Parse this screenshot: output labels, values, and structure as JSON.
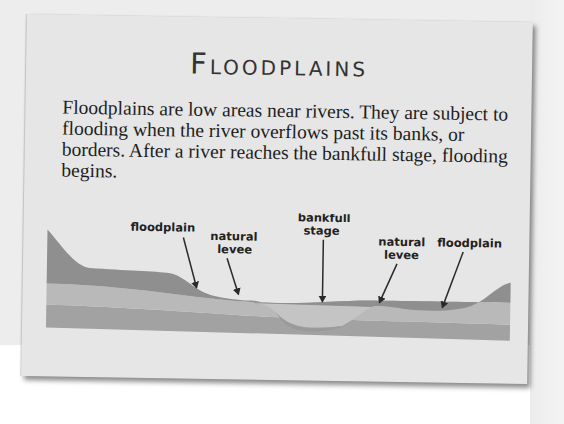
{
  "card": {
    "title": "Floodplains",
    "body": "Floodplains are low areas near rivers. They are subject to flooding when the river overflows past its banks, or borders. After a river reaches the bankfull stage, flooding begins."
  },
  "diagram": {
    "labels": {
      "floodplain_left": "floodplain",
      "levee_left_line1": "natural",
      "levee_left_line2": "levee",
      "bankfull_line1": "bankfull",
      "bankfull_line2": "stage",
      "levee_right_line1": "natural",
      "levee_right_line2": "levee",
      "floodplain_right": "floodplain"
    },
    "colors": {
      "topsoil": "#8f8f8f",
      "middle_layer": "#b9b9b9",
      "bedrock": "#a2a2a2",
      "water": "#c2c2c2",
      "arrow": "#2a2a2a",
      "card": "#e6e6e6"
    }
  }
}
